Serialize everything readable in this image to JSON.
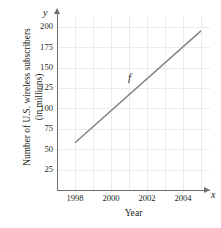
{
  "chart_data": {
    "type": "line",
    "title": "",
    "xlabel": "Year",
    "ylabel_line1": "Number of U.S. wireless subscribers",
    "ylabel_line2": "(in millions)",
    "axis_name_x": "x",
    "axis_name_y": "y",
    "series_label": "f",
    "grid": true,
    "legend": "none",
    "xlim": [
      1997,
      2005.5
    ],
    "ylim": [
      0,
      212
    ],
    "xticks": [
      1998,
      2000,
      2002,
      2004
    ],
    "xtick_labels": [
      "1998",
      "2000",
      "2002",
      "2004"
    ],
    "yticks": [
      25,
      50,
      75,
      100,
      125,
      150,
      175,
      200
    ],
    "ytick_labels": [
      "25",
      "50",
      "75",
      "100",
      "125",
      "150",
      "175",
      "200"
    ],
    "x_minor_gridlines": [
      1998,
      1999,
      2000,
      2001,
      2002,
      2003,
      2004,
      2005
    ],
    "series": [
      {
        "name": "f",
        "x": [
          1998,
          2005
        ],
        "values": [
          58,
          195
        ]
      }
    ],
    "line_color": "#7f8083",
    "grid_color": "#ebebeb",
    "axis_color": "#6d6e70",
    "text_color": "#231f20"
  }
}
